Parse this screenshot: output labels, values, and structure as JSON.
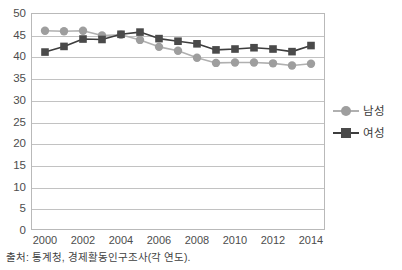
{
  "chart_data": {
    "type": "line",
    "title": "",
    "subtitle": "",
    "xlabel": "",
    "ylabel": "",
    "x": [
      2000,
      2001,
      2002,
      2003,
      2004,
      2005,
      2006,
      2007,
      2008,
      2009,
      2010,
      2011,
      2012,
      2013,
      2014
    ],
    "tick_labels_x": [
      "2000",
      "2002",
      "2004",
      "2006",
      "2008",
      "2010",
      "2012",
      "2014"
    ],
    "tick_values_x": [
      2000,
      2002,
      2004,
      2006,
      2008,
      2010,
      2012,
      2014
    ],
    "tick_labels_y": [
      "0",
      "5",
      "10",
      "15",
      "20",
      "25",
      "30",
      "35",
      "40",
      "45",
      "50"
    ],
    "tick_values_y": [
      0,
      5,
      10,
      15,
      20,
      25,
      30,
      35,
      40,
      45,
      50
    ],
    "ylim": [
      0,
      50
    ],
    "xlim": [
      2000,
      2014
    ],
    "grid": true,
    "grid_axis": "y",
    "legend_position": "right",
    "series": [
      {
        "name": "남성",
        "marker": "circle",
        "color": "#9e9e9e",
        "line_color": "#b0b0b0",
        "values": [
          45.9,
          45.8,
          45.9,
          44.8,
          45.0,
          43.8,
          42.2,
          41.3,
          39.7,
          38.5,
          38.6,
          38.6,
          38.4,
          37.9,
          38.3
        ]
      },
      {
        "name": "여성",
        "marker": "square",
        "color": "#4a4a4a",
        "line_color": "#3d3d3d",
        "values": [
          41.0,
          42.3,
          44.0,
          43.9,
          45.1,
          45.6,
          44.1,
          43.5,
          42.9,
          41.5,
          41.7,
          42.0,
          41.7,
          41.1,
          42.5
        ]
      }
    ],
    "annotations": []
  },
  "legend": {
    "items": [
      {
        "label": "남성",
        "color": "#9e9e9e",
        "line_color": "#b0b0b0",
        "marker": "circle"
      },
      {
        "label": "여성",
        "color": "#4a4a4a",
        "line_color": "#3d3d3d",
        "marker": "square"
      }
    ]
  },
  "source": {
    "text": "출처: 통계청, 경제활동인구조사(각 연도)."
  },
  "colors": {
    "plot_border": "#b9b9b9",
    "gridline": "#c2c2c2",
    "tick_text": "#4d4d4d",
    "background": "#ffffff"
  }
}
